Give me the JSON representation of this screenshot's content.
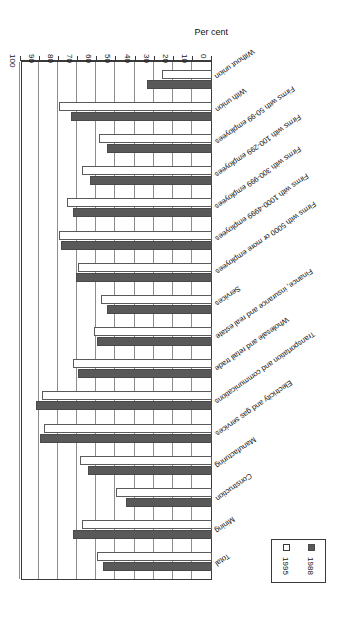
{
  "chart_data": {
    "type": "bar",
    "orientation": "horizontal",
    "title": "",
    "xlabel": "Per cent",
    "ylabel": "",
    "xlim": [
      0,
      100
    ],
    "xticks": [
      "0",
      "10",
      "20",
      "30",
      "40",
      "50",
      "60",
      "70",
      "80",
      "90",
      "100"
    ],
    "grid": true,
    "legend_position": "bottom-right",
    "categories": [
      "Total",
      "Mining",
      "Construction",
      "Manufacturing",
      "Electricity and gas services",
      "Transportation and communications",
      "Wholesale and retail trade",
      "Finance, insurance and real estate",
      "Services",
      "Firms with 5000 or more employees",
      "Firms with 1000-4999 employees",
      "Firms with 300-999 employees",
      "Firms with 100-299 employees",
      "Firms with 50-99 employees",
      "With union",
      "Without union"
    ],
    "series": [
      {
        "name": "1988",
        "color": "#595959",
        "values": [
          57,
          73,
          45,
          65,
          90,
          92,
          70,
          60,
          55,
          71,
          79,
          73,
          64,
          55,
          74,
          34
        ]
      },
      {
        "name": "1995",
        "color": "#ffffff",
        "values": [
          60,
          68,
          50,
          69,
          88,
          89,
          73,
          62,
          58,
          70,
          80,
          76,
          68,
          59,
          80,
          26
        ]
      }
    ]
  },
  "legend": {
    "entries": [
      {
        "label": "1988",
        "swatch": "filled-square"
      },
      {
        "label": "1995",
        "swatch": "open-square"
      }
    ]
  },
  "axis": {
    "title": "Per cent"
  }
}
